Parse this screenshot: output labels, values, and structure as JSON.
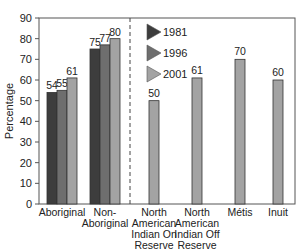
{
  "chart_data": {
    "type": "bar",
    "title": "",
    "xlabel": "",
    "ylabel": "Percentage",
    "ylim": [
      0,
      90
    ],
    "yticks": [
      0,
      10,
      20,
      30,
      40,
      50,
      60,
      70,
      80,
      90
    ],
    "grid": false,
    "legend_position": "inside-top-left-of-right-panel",
    "legend": [
      "1981",
      "1996",
      "2001"
    ],
    "colors": {
      "1981": "#3d3d3d",
      "1996": "#6e6e6e",
      "2001": "#a3a3a3"
    },
    "grouped": {
      "categories": [
        "Aboriginal",
        "Non-Aboriginal"
      ],
      "series": [
        {
          "name": "1981",
          "values": [
            54,
            75
          ]
        },
        {
          "name": "1996",
          "values": [
            55,
            77
          ]
        },
        {
          "name": "2001",
          "values": [
            61,
            80
          ]
        }
      ]
    },
    "single_2001": {
      "categories": [
        "North American Indian On Reserve",
        "North American Indian Off Reserve",
        "Métis",
        "Inuit"
      ],
      "values": [
        50,
        61,
        70,
        60
      ]
    },
    "separator": "dashed vertical line between grouped and single panels"
  },
  "labels": {
    "ylabel": "Percentage",
    "xticks": [
      [
        "Aboriginal"
      ],
      [
        "Non-",
        "Aboriginal"
      ],
      [
        "North",
        "American",
        "Indian On",
        "Reserve"
      ],
      [
        "North",
        "American",
        "Indian Off",
        "Reserve"
      ],
      [
        "Métis"
      ],
      [
        "Inuit"
      ]
    ],
    "legend": [
      "1981",
      "1996",
      "2001"
    ]
  }
}
